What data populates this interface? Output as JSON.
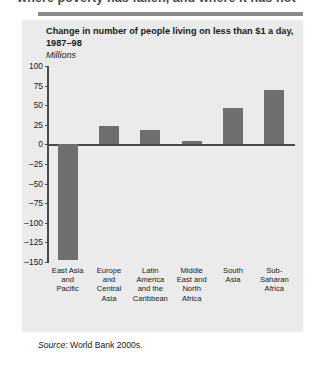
{
  "page": {
    "running_head": "where poverty has fallen, and where it has not",
    "source_prefix": "Source:",
    "source_text": "World Bank 2000s."
  },
  "chart_data": {
    "type": "bar",
    "title": "Change in number of people living on less than $1 a day, 1987–98",
    "subtitle": "Millions",
    "xlabel": "",
    "ylabel": "Millions",
    "categories": [
      "East Asia and Pacific",
      "Europe and Central Asia",
      "Latin America and the Caribbean",
      "Middle East and North Africa",
      "South Asia",
      "Sub-Saharan Africa"
    ],
    "category_lines": [
      [
        "East Asia",
        "and",
        "Pacific"
      ],
      [
        "Europe",
        "and",
        "Central",
        "Asia"
      ],
      [
        "Latin",
        "America",
        "and the",
        "Caribbean"
      ],
      [
        "Middle",
        "East and",
        "North",
        "Africa"
      ],
      [
        "South",
        "Asia"
      ],
      [
        "Sub-",
        "Saharan",
        "Africa"
      ]
    ],
    "values": [
      -147,
      24,
      18,
      4,
      47,
      70
    ],
    "ylim": [
      -150,
      100
    ],
    "yticks": [
      100,
      75,
      50,
      25,
      0,
      -25,
      -50,
      -75,
      -100,
      -125,
      -150
    ],
    "ytick_labels": [
      "100",
      "75",
      "50",
      "25",
      "0",
      "–25",
      "–50",
      "–75",
      "–100",
      "–125",
      "–150"
    ],
    "grid": false,
    "legend": null,
    "bar_color": "#6e6e6e",
    "axis_color": "#4a4a4a",
    "panel_color": "#ebebeb"
  }
}
